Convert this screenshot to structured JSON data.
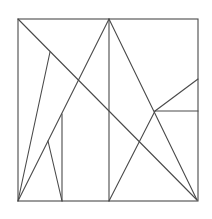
{
  "figure": {
    "stroke_color": "#4a4a4a",
    "background": "#ffffff",
    "square": {
      "x1": 18,
      "y1": 19,
      "x2": 198,
      "y2": 201
    },
    "segments": [
      {
        "id": "main-diagonal",
        "x1": 18,
        "y1": 19,
        "x2": 197,
        "y2": 200
      },
      {
        "id": "center-vertical",
        "x1": 109,
        "y1": 19,
        "x2": 109,
        "y2": 201
      },
      {
        "id": "apex-to-bottom-left",
        "x1": 109,
        "y1": 19,
        "x2": 18,
        "y2": 201
      },
      {
        "id": "apex-to-bottom-right",
        "x1": 109,
        "y1": 19,
        "x2": 197,
        "y2": 200
      },
      {
        "id": "diagonal-point-to-bottom-left",
        "x1": 50,
        "y1": 52,
        "x2": 18,
        "y2": 201
      },
      {
        "id": "inner-left-vertical",
        "x1": 62,
        "y1": 114,
        "x2": 62,
        "y2": 201
      },
      {
        "id": "small-triangle-edge",
        "x1": 48,
        "y1": 141,
        "x2": 62,
        "y2": 201
      },
      {
        "id": "bottom-center-to-right-point",
        "x1": 109,
        "y1": 201,
        "x2": 155,
        "y2": 111
      },
      {
        "id": "right-horizontal",
        "x1": 155,
        "y1": 111,
        "x2": 198,
        "y2": 111
      },
      {
        "id": "right-slant",
        "x1": 155,
        "y1": 111,
        "x2": 198,
        "y2": 79
      }
    ]
  }
}
